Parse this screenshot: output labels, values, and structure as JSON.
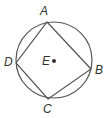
{
  "diagram": {
    "circle": {
      "cx": 54,
      "cy": 60,
      "r": 38,
      "stroke": "#555555"
    },
    "center": {
      "label": "E",
      "x": 54,
      "y": 60
    },
    "points": [
      {
        "label": "A",
        "x": 47,
        "y": 22
      },
      {
        "label": "B",
        "x": 91,
        "y": 69
      },
      {
        "label": "C",
        "x": 48,
        "y": 99
      },
      {
        "label": "D",
        "x": 16,
        "y": 63
      }
    ],
    "quadrilateral": "ABCD"
  }
}
